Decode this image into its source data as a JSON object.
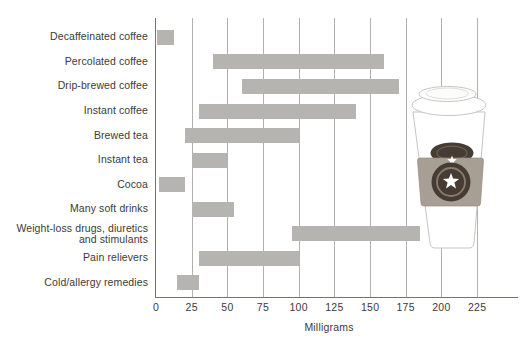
{
  "chart_data": {
    "type": "bar",
    "subtype": "horizontal-range-bars",
    "title": "",
    "xlabel": "Milligrams",
    "categories": [
      "Decaffeinated coffee",
      "Percolated coffee",
      "Drip-brewed coffee",
      "Instant coffee",
      "Brewed tea",
      "Instant tea",
      "Cocoa",
      "Many soft drinks",
      "Weight-loss drugs, diuretics\nand stimulants",
      "Pain relievers",
      "Cold/allergy remedies"
    ],
    "series": [
      {
        "name": "Caffeine content range (milligrams)",
        "ranges": [
          [
            1,
            13
          ],
          [
            40,
            160
          ],
          [
            60,
            170
          ],
          [
            30,
            140
          ],
          [
            20,
            100
          ],
          [
            25,
            50
          ],
          [
            2,
            20
          ],
          [
            25,
            55
          ],
          [
            95,
            185
          ],
          [
            30,
            100
          ],
          [
            15,
            30
          ]
        ]
      }
    ],
    "ticks": [
      0,
      25,
      50,
      75,
      100,
      125,
      150,
      175,
      200,
      225
    ],
    "xlim": [
      0,
      240
    ],
    "grid": true,
    "legend": false,
    "bar_color": "#b6b4b1",
    "gridline_color": "#b3b1ae",
    "axis_color": "#76736f",
    "text_color": "#3d3a36"
  },
  "illustration": {
    "name": "takeout-coffee-cup-with-sleeve-and-star-logo",
    "sleeve_color": "#a89f94",
    "logo_disc_color": "#463c33",
    "logo_ring_color": "#8a7c6d",
    "star_color": "#ffffff",
    "cup_outline_color": "#c6c5c3"
  }
}
